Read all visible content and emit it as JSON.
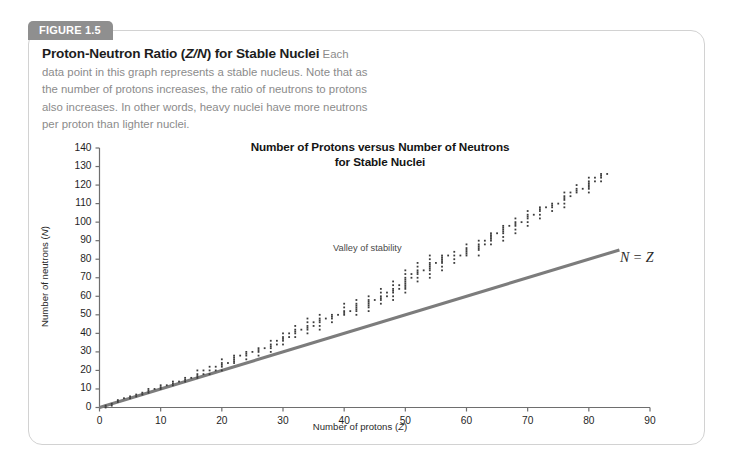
{
  "figure": {
    "tab_label": "FIGURE 1.5",
    "caption_title_part1": "Proton-Neutron Ratio (",
    "caption_title_italic": "Z/N",
    "caption_title_part2": ") for Stable Nuclei",
    "caption_body": "Each data point in this graph represents a stable nucleus. Note that as the number of protons increases, the ratio of neutrons to protons also increases. In other words, heavy nuclei have more neutrons per proton than lighter nuclei."
  },
  "colors": {
    "tab_background": "#8f8f8f",
    "tab_text": "#ffffff",
    "card_border": "#d2d2d2",
    "caption_body_text": "#8b8b8b",
    "caption_title_text": "#1d1d1d",
    "axis_line": "#6e6e6e",
    "data_point": "#3c3c3c",
    "reference_line": "#7c7c7c"
  },
  "chart_data": {
    "type": "scatter",
    "title": "Number of Protons versus Number of Neutrons for Stable Nuclei",
    "title_line1": "Number of Protons versus Number of Neutrons",
    "title_line2": "for Stable Nuclei",
    "xlabel": "Number of protons (Z)",
    "xlabel_text": "Number of protons (",
    "xlabel_italic": "Z",
    "xlabel_suffix": ")",
    "ylabel": "Number of neutrons (N)",
    "ylabel_text": "Number of neutrons (",
    "ylabel_italic": "N",
    "ylabel_suffix": ")",
    "xlim": [
      0,
      90
    ],
    "ylim": [
      0,
      140
    ],
    "xticks": [
      0,
      10,
      20,
      30,
      40,
      50,
      60,
      70,
      80,
      90
    ],
    "yticks": [
      0,
      10,
      20,
      30,
      40,
      50,
      60,
      70,
      80,
      90,
      100,
      110,
      120,
      130,
      140
    ],
    "grid": false,
    "legend": false,
    "annotations": [
      {
        "name": "valley-of-stability",
        "text": "Valley of stability",
        "x": 37,
        "y": 76
      },
      {
        "name": "n-equals-z",
        "text": "N = Z",
        "x": 84,
        "y": 72
      }
    ],
    "reference_line": {
      "name": "N = Z",
      "label": "N = Z",
      "x": [
        0,
        85
      ],
      "y": [
        0,
        85
      ]
    },
    "series": [
      {
        "name": "Stable nuclei",
        "marker": "dot",
        "description": "Each column is element Z with its stable isotope neutron numbers N",
        "points_by_z": [
          [
            1,
            [
              0,
              1
            ]
          ],
          [
            2,
            [
              1,
              2
            ]
          ],
          [
            3,
            [
              3,
              4
            ]
          ],
          [
            4,
            [
              5
            ]
          ],
          [
            5,
            [
              5,
              6
            ]
          ],
          [
            6,
            [
              6,
              7
            ]
          ],
          [
            7,
            [
              7,
              8
            ]
          ],
          [
            8,
            [
              8,
              9,
              10
            ]
          ],
          [
            9,
            [
              10
            ]
          ],
          [
            10,
            [
              10,
              11,
              12
            ]
          ],
          [
            11,
            [
              12
            ]
          ],
          [
            12,
            [
              12,
              13,
              14
            ]
          ],
          [
            13,
            [
              14
            ]
          ],
          [
            14,
            [
              14,
              15,
              16
            ]
          ],
          [
            15,
            [
              16
            ]
          ],
          [
            16,
            [
              16,
              17,
              18,
              20
            ]
          ],
          [
            17,
            [
              18,
              20
            ]
          ],
          [
            18,
            [
              18,
              20,
              22
            ]
          ],
          [
            19,
            [
              20,
              22
            ]
          ],
          [
            20,
            [
              20,
              22,
              23,
              24,
              26
            ]
          ],
          [
            21,
            [
              24
            ]
          ],
          [
            22,
            [
              24,
              25,
              26,
              27,
              28
            ]
          ],
          [
            23,
            [
              28
            ]
          ],
          [
            24,
            [
              26,
              28,
              29,
              30
            ]
          ],
          [
            25,
            [
              30
            ]
          ],
          [
            26,
            [
              28,
              30,
              31,
              32
            ]
          ],
          [
            27,
            [
              32
            ]
          ],
          [
            28,
            [
              30,
              32,
              33,
              34,
              36
            ]
          ],
          [
            29,
            [
              34,
              36
            ]
          ],
          [
            30,
            [
              34,
              36,
              37,
              38,
              40
            ]
          ],
          [
            31,
            [
              38,
              40
            ]
          ],
          [
            32,
            [
              38,
              40,
              41,
              42,
              44
            ]
          ],
          [
            33,
            [
              42
            ]
          ],
          [
            34,
            [
              40,
              42,
              43,
              44,
              46,
              48
            ]
          ],
          [
            35,
            [
              44,
              46
            ]
          ],
          [
            36,
            [
              42,
              44,
              46,
              47,
              48,
              50
            ]
          ],
          [
            37,
            [
              48
            ]
          ],
          [
            38,
            [
              46,
              48,
              49,
              50
            ]
          ],
          [
            39,
            [
              50
            ]
          ],
          [
            40,
            [
              50,
              51,
              52,
              54,
              56
            ]
          ],
          [
            41,
            [
              52
            ]
          ],
          [
            42,
            [
              50,
              52,
              53,
              54,
              55,
              56,
              58
            ]
          ],
          [
            44,
            [
              52,
              54,
              55,
              56,
              57,
              58,
              60
            ]
          ],
          [
            45,
            [
              58
            ]
          ],
          [
            46,
            [
              56,
              58,
              59,
              60,
              62,
              64
            ]
          ],
          [
            47,
            [
              60,
              62
            ]
          ],
          [
            48,
            [
              58,
              60,
              62,
              63,
              64,
              66,
              68
            ]
          ],
          [
            49,
            [
              64,
              66
            ]
          ],
          [
            50,
            [
              62,
              64,
              65,
              66,
              67,
              68,
              69,
              70,
              72,
              74
            ]
          ],
          [
            51,
            [
              70,
              72
            ]
          ],
          [
            52,
            [
              68,
              70,
              72,
              73,
              74,
              76,
              78
            ]
          ],
          [
            53,
            [
              74
            ]
          ],
          [
            54,
            [
              70,
              72,
              74,
              75,
              76,
              77,
              78,
              80,
              82
            ]
          ],
          [
            55,
            [
              78
            ]
          ],
          [
            56,
            [
              74,
              76,
              78,
              79,
              80,
              81,
              82
            ]
          ],
          [
            57,
            [
              82
            ]
          ],
          [
            58,
            [
              78,
              80,
              82,
              84
            ]
          ],
          [
            59,
            [
              82
            ]
          ],
          [
            60,
            [
              82,
              83,
              84,
              85,
              86,
              88
            ]
          ],
          [
            62,
            [
              82,
              85,
              86,
              87,
              88,
              90
            ]
          ],
          [
            63,
            [
              88,
              90
            ]
          ],
          [
            64,
            [
              88,
              90,
              91,
              92,
              93,
              94
            ]
          ],
          [
            65,
            [
              94
            ]
          ],
          [
            66,
            [
              90,
              92,
              94,
              95,
              96,
              97,
              98
            ]
          ],
          [
            67,
            [
              98
            ]
          ],
          [
            68,
            [
              94,
              96,
              98,
              99,
              100,
              102
            ]
          ],
          [
            69,
            [
              100
            ]
          ],
          [
            70,
            [
              98,
              100,
              102,
              103,
              104,
              106
            ]
          ],
          [
            71,
            [
              104
            ]
          ],
          [
            72,
            [
              102,
              104,
              106,
              107,
              108
            ]
          ],
          [
            73,
            [
              108
            ]
          ],
          [
            74,
            [
              106,
              108,
              109,
              110
            ]
          ],
          [
            75,
            [
              110
            ]
          ],
          [
            76,
            [
              108,
              110,
              112,
              113,
              114,
              116
            ]
          ],
          [
            77,
            [
              114,
              116
            ]
          ],
          [
            78,
            [
              116,
              117,
              118,
              120
            ]
          ],
          [
            79,
            [
              118
            ]
          ],
          [
            80,
            [
              116,
              118,
              119,
              120,
              121,
              122,
              124
            ]
          ],
          [
            81,
            [
              122,
              124
            ]
          ],
          [
            82,
            [
              122,
              124,
              125,
              126
            ]
          ],
          [
            83,
            [
              126
            ]
          ]
        ]
      }
    ]
  }
}
